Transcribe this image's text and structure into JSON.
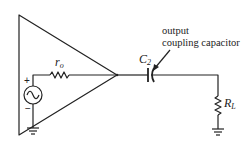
{
  "diagram": {
    "type": "amplifier-output-equivalent-circuit",
    "stroke_color": "#222222",
    "components": {
      "amplifier": {
        "shape": "triangle"
      },
      "source": {
        "symbol": "~",
        "plus": "+",
        "minus": "−"
      },
      "output_resistance": {
        "label": "r",
        "subscript": "o"
      },
      "capacitor": {
        "label": "C",
        "subscript": "2"
      },
      "load_resistor": {
        "label": "R",
        "subscript": "L"
      }
    },
    "annotation": {
      "line1": "output",
      "line2": "coupling capacitor"
    }
  }
}
